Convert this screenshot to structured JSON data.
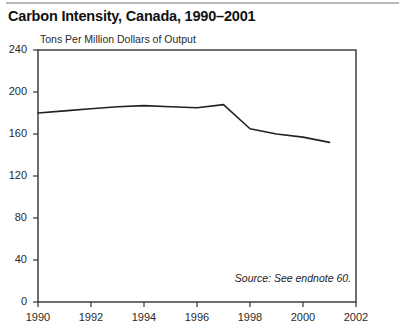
{
  "figure": {
    "title": "Carbon Intensity, Canada, 1990–2001",
    "unit_label": "Tons Per Million Dollars of Output",
    "source_note": "Source: See endnote 60."
  },
  "chart_data": {
    "type": "line",
    "title": "Carbon Intensity, Canada, 1990–2001",
    "subtitle": "",
    "xlabel": "",
    "ylabel": "Tons Per Million Dollars of Output",
    "x": [
      1990,
      1991,
      1992,
      1993,
      1994,
      1995,
      1996,
      1997,
      1998,
      1999,
      2000,
      2001
    ],
    "values": [
      180,
      182,
      184,
      186,
      187,
      186,
      185,
      188,
      165,
      160,
      157,
      152
    ],
    "series": [
      {
        "name": "Carbon Intensity",
        "values": [
          180,
          182,
          184,
          186,
          187,
          186,
          185,
          188,
          165,
          160,
          157,
          152
        ]
      }
    ],
    "xlim": [
      1990,
      2002
    ],
    "ylim": [
      0,
      240
    ],
    "ytick_labels": [
      "0",
      "40",
      "80",
      "120",
      "160",
      "200",
      "240"
    ],
    "ytick_values": [
      0,
      40,
      80,
      120,
      160,
      200,
      240
    ],
    "xtick_labels": [
      "1990",
      "1992",
      "1994",
      "1996",
      "1998",
      "2000",
      "2002"
    ],
    "xtick_values": [
      1990,
      1992,
      1994,
      1996,
      1998,
      2000,
      2002
    ],
    "grid": false,
    "legend": "none",
    "line_color": "#222222",
    "frame_color": "#333333",
    "background_color": "#ffffff",
    "annotations": [
      "Source: See endnote 60."
    ]
  }
}
